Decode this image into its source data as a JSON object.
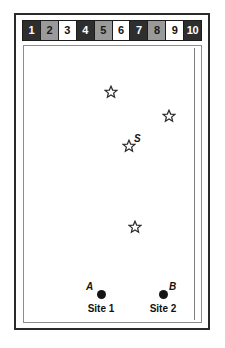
{
  "figure": {
    "frame_color": "#2a2a2a",
    "background_color": "#ffffff"
  },
  "scale_strip": {
    "name": "distance-scale",
    "cells": [
      {
        "label": "1",
        "fill": "dark"
      },
      {
        "label": "2",
        "fill": "gray"
      },
      {
        "label": "3",
        "fill": "white"
      },
      {
        "label": "4",
        "fill": "dark"
      },
      {
        "label": "5",
        "fill": "gray"
      },
      {
        "label": "6",
        "fill": "white"
      },
      {
        "label": "7",
        "fill": "dark"
      },
      {
        "label": "8",
        "fill": "gray"
      },
      {
        "label": "9",
        "fill": "white"
      },
      {
        "label": "10",
        "fill": "dark"
      }
    ]
  },
  "map": {
    "stars": [
      {
        "id": "star-1",
        "label": "",
        "x": 87,
        "y": 46
      },
      {
        "id": "star-2",
        "label": "",
        "x": 145,
        "y": 70
      },
      {
        "id": "star-3",
        "label": "S",
        "x": 105,
        "y": 100,
        "label_x": 110,
        "label_y": 88
      },
      {
        "id": "star-4",
        "label": "",
        "x": 111,
        "y": 181
      }
    ],
    "sites": [
      {
        "id": "site-a",
        "point_label": "A",
        "name": "Site 1",
        "x": 77,
        "y": 248,
        "label_x": 62,
        "label_y": 236,
        "name_x": 77,
        "name_y": 258
      },
      {
        "id": "site-b",
        "point_label": "B",
        "name": "Site 2",
        "x": 139,
        "y": 248,
        "label_x": 145,
        "label_y": 236,
        "name_x": 139,
        "name_y": 258
      }
    ]
  }
}
